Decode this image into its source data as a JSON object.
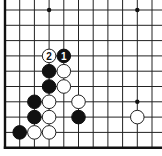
{
  "diagram": {
    "type": "go-board-fragment",
    "grid": {
      "columns": 11,
      "rows": 10,
      "x0": 5,
      "dx": 14.7,
      "y0": 10,
      "dy": 15.3,
      "edges": {
        "left": true,
        "bottom": true,
        "top": false,
        "right": false
      }
    },
    "colors": {
      "line": "#222222",
      "black": "#111111",
      "white": "#ffffff"
    },
    "star_points": [
      {
        "col": 3,
        "row": 0
      },
      {
        "col": 9,
        "row": 0
      },
      {
        "col": 9,
        "row": 6
      }
    ],
    "stones": [
      {
        "col": 3,
        "row": 3,
        "color": "white",
        "label": "2"
      },
      {
        "col": 4,
        "row": 3,
        "color": "black",
        "label": "1"
      },
      {
        "col": 3,
        "row": 4,
        "color": "black",
        "label": ""
      },
      {
        "col": 4,
        "row": 4,
        "color": "white",
        "label": ""
      },
      {
        "col": 3,
        "row": 5,
        "color": "black",
        "label": ""
      },
      {
        "col": 4,
        "row": 5,
        "color": "white",
        "label": ""
      },
      {
        "col": 2,
        "row": 6,
        "color": "black",
        "label": ""
      },
      {
        "col": 3,
        "row": 6,
        "color": "white",
        "label": ""
      },
      {
        "col": 5,
        "row": 6,
        "color": "white",
        "label": ""
      },
      {
        "col": 2,
        "row": 7,
        "color": "black",
        "label": ""
      },
      {
        "col": 3,
        "row": 7,
        "color": "white",
        "label": ""
      },
      {
        "col": 5,
        "row": 7,
        "color": "black",
        "label": ""
      },
      {
        "col": 9,
        "row": 7,
        "color": "white",
        "label": ""
      },
      {
        "col": 1,
        "row": 8,
        "color": "black",
        "label": ""
      },
      {
        "col": 2,
        "row": 8,
        "color": "white",
        "label": ""
      },
      {
        "col": 3,
        "row": 8,
        "color": "white",
        "label": ""
      }
    ]
  }
}
